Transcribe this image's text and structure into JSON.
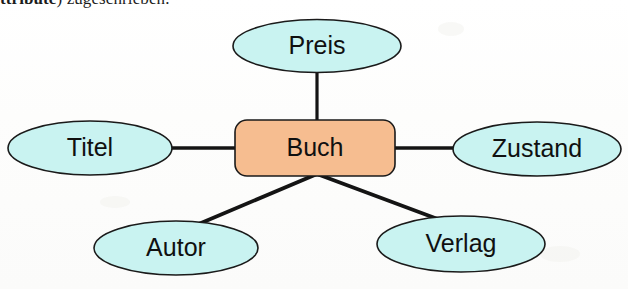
{
  "page": {
    "width": 628,
    "height": 289,
    "background_color": "#fefefe"
  },
  "caption": {
    "partial_line": "ttribute) zugeschrieben.",
    "bold_fragment": "ttribute",
    "rest_fragment": ") zugeschrieben.",
    "note": "line of German body text clipped by the top edge of the scan"
  },
  "colors": {
    "attribute_fill": "#c9f3f1",
    "attribute_stroke": "#1a1a1a",
    "entity_fill": "#f6bd90",
    "entity_stroke": "#1a1a1a",
    "connector": "#141414",
    "text": "#101010",
    "background": "#fefefe"
  },
  "diagram": {
    "type": "entity-relationship",
    "language": "de",
    "entity": {
      "label": "Buch",
      "shape": "rounded-rectangle",
      "x": 235,
      "y": 120,
      "width": 160,
      "height": 56,
      "corner_radius": 12
    },
    "attributes": [
      {
        "id": "preis",
        "label": "Preis",
        "shape": "ellipse",
        "cx": 317,
        "cy": 46,
        "rx": 84,
        "ry": 27,
        "position": "top"
      },
      {
        "id": "titel",
        "label": "Titel",
        "shape": "ellipse",
        "cx": 90,
        "cy": 148,
        "rx": 82,
        "ry": 27,
        "position": "left"
      },
      {
        "id": "zustand",
        "label": "Zustand",
        "shape": "ellipse",
        "cx": 537,
        "cy": 149,
        "rx": 84,
        "ry": 27,
        "position": "right"
      },
      {
        "id": "autor",
        "label": "Autor",
        "shape": "ellipse",
        "cx": 176,
        "cy": 248,
        "rx": 82,
        "ry": 27,
        "position": "bottom-left"
      },
      {
        "id": "verlag",
        "label": "Verlag",
        "shape": "ellipse",
        "cx": 461,
        "cy": 244,
        "rx": 84,
        "ry": 28,
        "position": "bottom-right"
      }
    ],
    "connectors": [
      {
        "id": "edge-preis",
        "from": "buch",
        "to": "preis",
        "x1": 317,
        "y1": 122,
        "x2": 317,
        "y2": 73,
        "orientation": "vertical"
      },
      {
        "id": "edge-titel",
        "from": "buch",
        "to": "titel",
        "x1": 235,
        "y1": 148,
        "x2": 172,
        "y2": 148,
        "orientation": "horizontal"
      },
      {
        "id": "edge-zustand",
        "from": "buch",
        "to": "zustand",
        "x1": 395,
        "y1": 148,
        "x2": 455,
        "y2": 148,
        "orientation": "horizontal"
      },
      {
        "id": "edge-autor",
        "from": "buch",
        "to": "autor",
        "x1": 317,
        "y1": 176,
        "x2": 196,
        "y2": 225,
        "orientation": "diagonal"
      },
      {
        "id": "edge-verlag",
        "from": "buch",
        "to": "verlag",
        "x1": 317,
        "y1": 176,
        "x2": 441,
        "y2": 220,
        "orientation": "diagonal"
      }
    ]
  }
}
